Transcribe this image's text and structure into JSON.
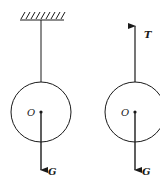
{
  "diagram": {
    "colors": {
      "stroke": "#1a1a1a",
      "background": "#ffffff"
    },
    "left_figure": {
      "support": "hatched-ceiling",
      "center_label": "O",
      "force_labels": [
        "G"
      ]
    },
    "right_figure": {
      "center_label": "O",
      "force_labels": [
        "T",
        "G"
      ]
    },
    "labels": {
      "left_center": "O",
      "left_weight": "G",
      "right_center": "O",
      "right_tension": "T",
      "right_weight": "G"
    }
  }
}
